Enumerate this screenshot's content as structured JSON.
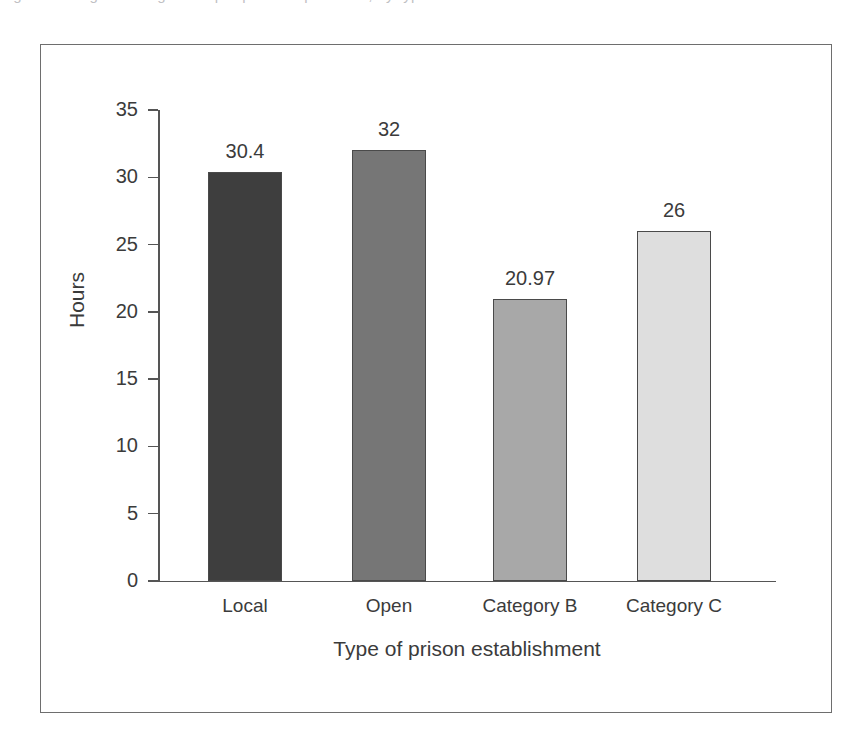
{
  "figure": {
    "top_caption_sliver": "Figure   Average working hours per prisoner per week, by type of establishment",
    "frame_color": "#6e6e6e",
    "background": "#ffffff"
  },
  "chart_data": {
    "type": "bar",
    "title": "",
    "xlabel": "Type of prison establishment",
    "ylabel": "Hours",
    "categories": [
      "Local",
      "Open",
      "Category B",
      "Category C"
    ],
    "values": [
      30.4,
      32,
      20.97,
      26
    ],
    "value_labels": [
      "30.4",
      "32",
      "20.97",
      "26"
    ],
    "bar_colors": [
      "#3e3e3e",
      "#767676",
      "#a8a8a8",
      "#dedede"
    ],
    "bar_edge_color": "#4a4a4a",
    "ylim": [
      0,
      35
    ],
    "yticks": [
      0,
      5,
      10,
      15,
      20,
      25,
      30,
      35
    ],
    "ytick_labels": [
      "0",
      "5",
      "10",
      "15",
      "20",
      "25",
      "30",
      "35"
    ],
    "grid": false,
    "legend": null,
    "axis_color": "#555555"
  }
}
